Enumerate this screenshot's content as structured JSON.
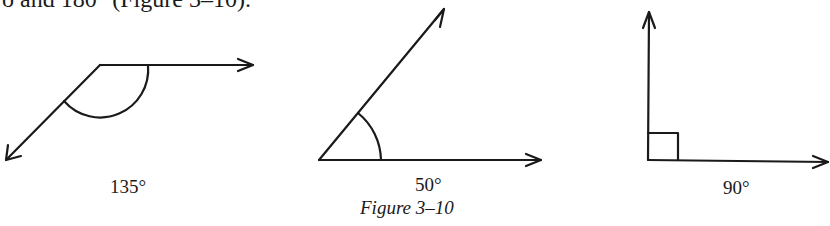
{
  "text": {
    "top_line": "o and 180° (Figure 3–10)."
  },
  "figure": {
    "caption": "Figure 3–10",
    "angles": [
      {
        "label": "135°",
        "measure": 135,
        "type": "obtuse"
      },
      {
        "label": "50°",
        "measure": 50,
        "type": "acute"
      },
      {
        "label": "90°",
        "measure": 90,
        "type": "right"
      }
    ]
  }
}
